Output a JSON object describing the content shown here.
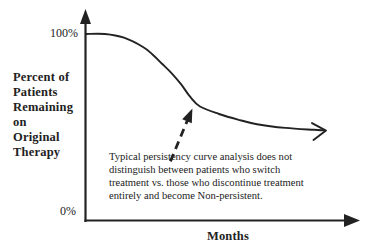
{
  "colors": {
    "ink": "#222222",
    "background": "#ffffff"
  },
  "figure": {
    "ylabel_lines": [
      "Percent of",
      "Patients",
      "Remaining",
      "on",
      "Original",
      "Therapy"
    ],
    "ytick_top": "100%",
    "ytick_bottom": "0%",
    "xlabel": "Months",
    "annotation_lines": [
      "Typical persistency curve analysis does not",
      "distinguish between patients who switch",
      "treatment vs. those who discontinue treatment",
      "entirely and become Non-persistent."
    ]
  },
  "chart_data": {
    "type": "line",
    "title": "",
    "xlabel": "Months",
    "ylabel": "Percent of Patients Remaining on Original Therapy",
    "y_tick_labels": [
      "100%",
      "0%"
    ],
    "ylim": [
      0,
      100
    ],
    "x_range_months": [
      0,
      26
    ],
    "grid": false,
    "legend": false,
    "series": [
      {
        "name": "Typical persistency curve",
        "x": [
          0,
          2,
          4,
          6,
          7,
          8,
          9,
          10,
          11,
          12,
          14,
          16,
          18,
          21,
          24,
          25
        ],
        "y": [
          100,
          100,
          98,
          93,
          89,
          84,
          79,
          73,
          66,
          61,
          57,
          54,
          51.5,
          49.5,
          48.5,
          48.2
        ]
      }
    ],
    "annotation": {
      "text": "Typical persistency curve analysis does not distinguish between patients who switch treatment vs. those who discontinue treatment entirely and become Non-persistent.",
      "arrow_target": {
        "x": 11.2,
        "y": 60
      }
    }
  }
}
